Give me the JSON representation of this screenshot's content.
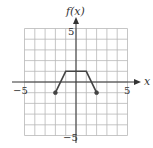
{
  "chart_data": {
    "type": "line",
    "title": "",
    "xlabel": "x",
    "ylabel": "f(x)",
    "xlim": [
      -5,
      5
    ],
    "ylim": [
      -5,
      5
    ],
    "grid": true,
    "x_ticks_labeled": [
      -5,
      5
    ],
    "y_ticks_labeled": [
      5,
      -5
    ],
    "series": [
      {
        "name": "f(x)",
        "x": [
          -2,
          -1,
          1,
          2
        ],
        "y": [
          -1,
          1,
          1,
          -1
        ],
        "endpoints": [
          {
            "x": -2,
            "y": -1,
            "marker": "closed"
          },
          {
            "x": 2,
            "y": -1,
            "marker": "closed"
          }
        ]
      }
    ]
  },
  "labels": {
    "y_axis": "f(x)",
    "x_axis": "x",
    "x_min": "−5",
    "x_max": "5",
    "y_max": "5",
    "y_min": "−5"
  },
  "colors": {
    "grid": "#b8b8b8",
    "axis": "#333333",
    "curve": "#444444"
  }
}
